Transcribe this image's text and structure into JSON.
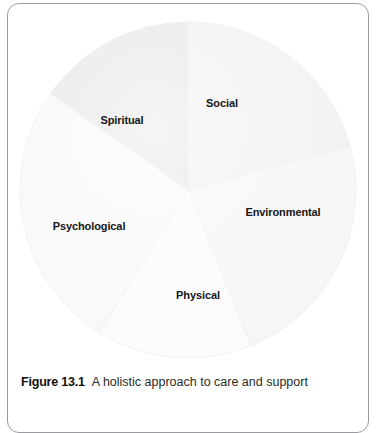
{
  "figure": {
    "number_label": "Figure 13.1",
    "caption_text": "A holistic approach to care and support"
  },
  "colors": {
    "frame_border": "#9a9a9f",
    "page_background": "#ffffff",
    "label_text": "#161616",
    "caption_text": "#2a2a2a",
    "slice_social": "#f1f1f1",
    "slice_environmental": "#f6f6f6",
    "slice_physical": "#fbfbfb",
    "slice_psychological": "#f8f8f8",
    "slice_spiritual": "#e7e7e7",
    "slice_outline": "#ededed"
  },
  "chart_data": {
    "type": "pie",
    "title": "A holistic approach to care and support",
    "subtitle": "",
    "xlabel": "",
    "ylabel": "",
    "legend_position": "none",
    "grid": false,
    "labels_inside_slices": true,
    "start_angle_deg": 0,
    "direction": "clockwise",
    "categories": [
      "Social",
      "Environmental",
      "Physical",
      "Psychological",
      "Spiritual"
    ],
    "values": [
      21,
      23,
      15,
      26,
      15
    ],
    "units": "percent",
    "slices": [
      {
        "label": "Social",
        "value": 21,
        "start_angle_deg": 0,
        "end_angle_deg": 75,
        "fill": "#f1f1f1",
        "label_x": 222,
        "label_y": 103
      },
      {
        "label": "Environmental",
        "value": 23,
        "start_angle_deg": 75,
        "end_angle_deg": 158,
        "fill": "#f6f6f6",
        "label_x": 283,
        "label_y": 212
      },
      {
        "label": "Physical",
        "value": 15,
        "start_angle_deg": 158,
        "end_angle_deg": 212,
        "fill": "#fbfbfb",
        "label_x": 198,
        "label_y": 295
      },
      {
        "label": "Psychological",
        "value": 26,
        "start_angle_deg": 212,
        "end_angle_deg": 305,
        "fill": "#f8f8f8",
        "label_x": 89,
        "label_y": 226
      },
      {
        "label": "Spiritual",
        "value": 15,
        "start_angle_deg": 305,
        "end_angle_deg": 360,
        "fill": "#e7e7e7",
        "label_x": 122,
        "label_y": 120
      }
    ],
    "geometry": {
      "center_x": 188,
      "center_y": 190,
      "radius": 168
    }
  }
}
